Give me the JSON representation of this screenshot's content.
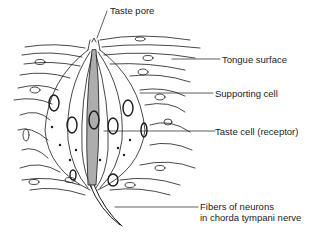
{
  "diagram": {
    "labels": {
      "taste_pore": "Taste pore",
      "tongue_surface": "Tongue surface",
      "supporting_cell": "Supporting cell",
      "taste_cell": "Taste cell (receptor)",
      "fibers_line1": "Fibers of neurons",
      "fibers_line2": "in chorda tympani nerve"
    },
    "colors": {
      "line": "#1a1a1a",
      "receptor_fill": "#8a8a8a",
      "background": "#ffffff"
    }
  }
}
